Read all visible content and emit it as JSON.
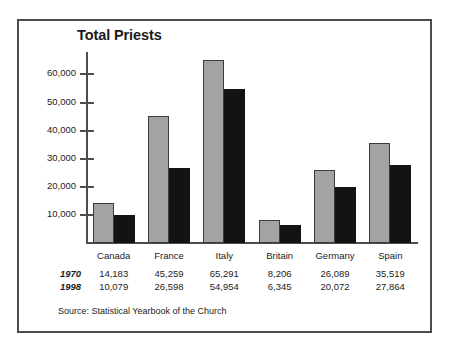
{
  "chart_data": {
    "type": "bar",
    "title": "Total Priests",
    "xlabel": "",
    "ylabel": "",
    "grid": false,
    "legend": "none",
    "ylim": [
      0,
      68000
    ],
    "yticks": [
      "10,000",
      "20,000",
      "30,000",
      "40,000",
      "50,000",
      "60,000"
    ],
    "ytick_values": [
      10000,
      20000,
      30000,
      40000,
      50000,
      60000
    ],
    "categories": [
      "Canada",
      "France",
      "Italy",
      "Britain",
      "Germany",
      "Spain"
    ],
    "series": [
      {
        "name": "1970",
        "color": "#a3a3a3",
        "values": [
          14183,
          45259,
          65291,
          8206,
          26089,
          35519
        ],
        "labels": [
          "14,183",
          "45,259",
          "65,291",
          "8,206",
          "26,089",
          "35,519"
        ]
      },
      {
        "name": "1998",
        "color": "#131313",
        "values": [
          10079,
          26598,
          54954,
          6345,
          20072,
          27864
        ],
        "labels": [
          "10,079",
          "26,598",
          "54,954",
          "6,345",
          "20,072",
          "27,864"
        ]
      }
    ],
    "source": "Source: Statistical Yearbook of the Church"
  },
  "title": "Total Priests",
  "source": "Source: Statistical Yearbook of the Church"
}
